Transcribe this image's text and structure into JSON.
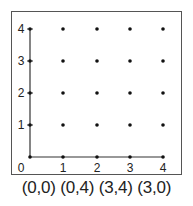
{
  "diagram": {
    "type": "coordinate-grid",
    "x_ticks": [
      "0",
      "1",
      "2",
      "3",
      "4"
    ],
    "y_ticks": [
      "1",
      "2",
      "3",
      "4"
    ],
    "origin_label": "0",
    "grid_points": "integer lattice 0..4 x 0..4",
    "axis_color": "#333333",
    "dot_color": "#111111"
  },
  "caption": "(0,0) (0,4) (3,4) (3,0)",
  "points": [
    {
      "label": "(0,0)",
      "x": 0,
      "y": 0
    },
    {
      "label": "(0,4)",
      "x": 0,
      "y": 4
    },
    {
      "label": "(3,4)",
      "x": 3,
      "y": 4
    },
    {
      "label": "(3,0)",
      "x": 3,
      "y": 0
    }
  ]
}
